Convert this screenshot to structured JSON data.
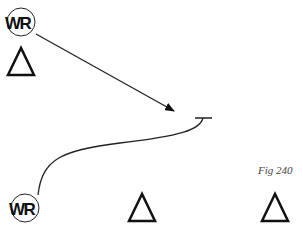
{
  "figure": {
    "label": "Fig 240"
  },
  "players": [
    {
      "id": "wr-top",
      "label": "WR",
      "type": "receiver"
    },
    {
      "id": "wr-bottom",
      "label": "WR",
      "type": "receiver"
    }
  ],
  "defenders": [
    {
      "id": "def-top-left",
      "shape": "triangle"
    },
    {
      "id": "def-bottom-middle",
      "shape": "triangle"
    },
    {
      "id": "def-bottom-right",
      "shape": "triangle"
    }
  ],
  "routes": [
    {
      "from": "wr-top",
      "type": "arrow"
    },
    {
      "from": "wr-bottom",
      "type": "block-curve"
    }
  ],
  "colors": {
    "ink": "#111111",
    "label": "#444444"
  }
}
